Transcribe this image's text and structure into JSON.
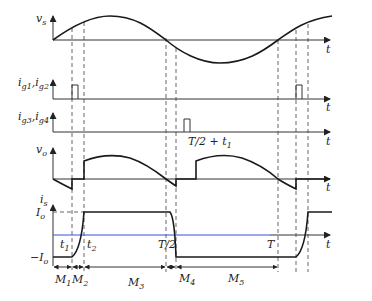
{
  "diagram": {
    "panels": [
      {
        "id": "vs",
        "ylabel": "v",
        "ylabel_sub": "s",
        "xlabel": "t"
      },
      {
        "id": "ig12",
        "ylabel": "i",
        "ylabel_parts": [
          "g1",
          "g2"
        ],
        "xlabel": "t"
      },
      {
        "id": "ig34",
        "ylabel": "i",
        "ylabel_parts": [
          "g3",
          "g4"
        ],
        "xlabel": "t",
        "annotation": "T/2 + t",
        "annotation_sub": "1"
      },
      {
        "id": "vo",
        "ylabel": "v",
        "ylabel_sub": "o",
        "xlabel": "t"
      },
      {
        "id": "is",
        "ylabel": "i",
        "ylabel_sub": "s",
        "xlabel": "t",
        "level_labels": {
          "pos": "I",
          "pos_sub": "o",
          "neg": "−I",
          "neg_sub": "o"
        },
        "time_labels": [
          {
            "text": "t",
            "sub": "1"
          },
          {
            "text": "t",
            "sub": "2"
          },
          {
            "text": "T/2",
            "sub": ""
          },
          {
            "text": "T",
            "sub": ""
          }
        ]
      }
    ],
    "intervals": [
      {
        "text": "M",
        "sub": "1"
      },
      {
        "text": "M",
        "sub": "2"
      },
      {
        "text": "M",
        "sub": "3"
      },
      {
        "text": "M",
        "sub": "4"
      },
      {
        "text": "M",
        "sub": "5"
      }
    ]
  }
}
